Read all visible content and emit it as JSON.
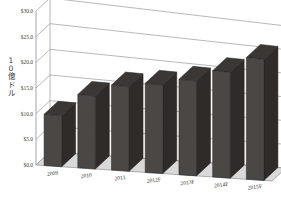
{
  "chart_data": {
    "type": "bar",
    "title": "",
    "subtitle": "",
    "xlabel": "",
    "ylabel": "10億ドル",
    "categories": [
      "2009",
      "2010",
      "2011",
      "2012F",
      "2013F",
      "2014F",
      "2015F"
    ],
    "values": [
      10.0,
      14.5,
      17.0,
      18.0,
      19.5,
      22.0,
      25.5
    ],
    "series": [
      {
        "name": "",
        "values": [
          10.0,
          14.5,
          17.0,
          18.0,
          19.5,
          22.0,
          25.5
        ]
      }
    ],
    "ytick_labels": [
      "$0.0",
      "$5.0",
      "$10.0",
      "$15.0",
      "$20.0",
      "$25.0",
      "$30.0"
    ],
    "ytick_values": [
      0.0,
      5.0,
      10.0,
      15.0,
      20.0,
      25.0,
      30.0
    ],
    "ylim": [
      0.0,
      30.0
    ],
    "grid": true,
    "legend": false,
    "legend_position": "none",
    "three_d": true,
    "bar_color": "#4a4744",
    "bar_side_color": "#2e2b29",
    "bar_top_color": "#3a3734",
    "grid_color": "#9a9a9a",
    "floor_color": "#d9d9d9",
    "background": "#ffffff",
    "annotations": []
  },
  "axis": {
    "y_title_chars": [
      "1",
      "0",
      "億",
      "ド",
      "ル"
    ]
  }
}
